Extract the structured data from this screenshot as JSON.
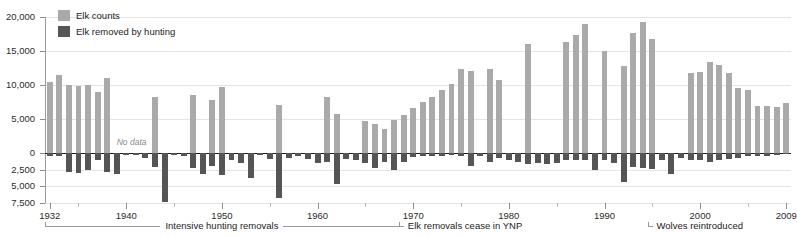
{
  "legend": {
    "items": [
      {
        "label": "Elk counts",
        "color": "#aaaaaa",
        "key": "counts"
      },
      {
        "label": "Elk removed by hunting",
        "color": "#555555",
        "key": "removed"
      }
    ]
  },
  "annotations": {
    "no_data": "No data",
    "brackets": [
      {
        "label": "Intensive hunting removals",
        "start_year": 1932,
        "end_year": 1968,
        "style": "span"
      },
      {
        "label": "Elk removals cease in YNP",
        "start_year": 1969,
        "end_year": 1969,
        "style": "corner"
      },
      {
        "label": "Wolves reintroduced",
        "start_year": 1995,
        "end_year": 1995,
        "style": "corner"
      }
    ]
  },
  "chart_data": {
    "type": "bar",
    "title": "",
    "xlabel": "",
    "ylabel": "",
    "orientation": "vertical",
    "grid": true,
    "legend_position": "top-left",
    "x_range": [
      1932,
      2009
    ],
    "x_ticks": [
      1932,
      1940,
      1950,
      1960,
      1970,
      1980,
      1990,
      2000,
      2009
    ],
    "x_minor_ticks": [
      1935,
      1945,
      1955,
      1965,
      1975,
      1985,
      1995,
      2005
    ],
    "y_axis_note": "Asymmetric scale: above zero 0 to 20,000 in 5,000 steps; below zero 0 to 7,500 in 2,500 steps",
    "y_ticks_positive": [
      0,
      5000,
      10000,
      15000,
      20000
    ],
    "y_ticks_negative": [
      2500,
      5000,
      7500
    ],
    "y_tick_labels": [
      "20,000",
      "15,000",
      "10,000",
      "5,000",
      "0",
      "2,500",
      "5,000",
      "7,500"
    ],
    "ylim_positive": [
      0,
      20000
    ],
    "ylim_negative": [
      0,
      7500
    ],
    "series": [
      {
        "name": "Elk counts",
        "color": "#aaaaaa",
        "direction": "up",
        "values": [
          {
            "year": 1932,
            "value": 10400
          },
          {
            "year": 1933,
            "value": 11400
          },
          {
            "year": 1934,
            "value": 10000
          },
          {
            "year": 1935,
            "value": 9900
          },
          {
            "year": 1936,
            "value": 10000
          },
          {
            "year": 1937,
            "value": 8900
          },
          {
            "year": 1938,
            "value": 11000
          },
          {
            "year": 1939,
            "value": null
          },
          {
            "year": 1940,
            "value": null
          },
          {
            "year": 1941,
            "value": null
          },
          {
            "year": 1942,
            "value": null
          },
          {
            "year": 1943,
            "value": 8300
          },
          {
            "year": 1944,
            "value": null
          },
          {
            "year": 1945,
            "value": null
          },
          {
            "year": 1946,
            "value": null
          },
          {
            "year": 1947,
            "value": 8500
          },
          {
            "year": 1948,
            "value": null
          },
          {
            "year": 1949,
            "value": 7800
          },
          {
            "year": 1950,
            "value": 9700
          },
          {
            "year": 1951,
            "value": null
          },
          {
            "year": 1952,
            "value": null
          },
          {
            "year": 1953,
            "value": null
          },
          {
            "year": 1954,
            "value": null
          },
          {
            "year": 1955,
            "value": null
          },
          {
            "year": 1956,
            "value": 7000
          },
          {
            "year": 1957,
            "value": null
          },
          {
            "year": 1958,
            "value": null
          },
          {
            "year": 1959,
            "value": null
          },
          {
            "year": 1960,
            "value": null
          },
          {
            "year": 1961,
            "value": 8200
          },
          {
            "year": 1962,
            "value": 5700
          },
          {
            "year": 1963,
            "value": null
          },
          {
            "year": 1964,
            "value": null
          },
          {
            "year": 1965,
            "value": 4700
          },
          {
            "year": 1966,
            "value": 4200
          },
          {
            "year": 1967,
            "value": 3500
          },
          {
            "year": 1968,
            "value": 4800
          },
          {
            "year": 1969,
            "value": 5600
          },
          {
            "year": 1970,
            "value": 6600
          },
          {
            "year": 1971,
            "value": 7500
          },
          {
            "year": 1972,
            "value": 8200
          },
          {
            "year": 1973,
            "value": 9200
          },
          {
            "year": 1974,
            "value": 10200
          },
          {
            "year": 1975,
            "value": 12400
          },
          {
            "year": 1976,
            "value": 12000
          },
          {
            "year": 1977,
            "value": null
          },
          {
            "year": 1978,
            "value": 12300
          },
          {
            "year": 1979,
            "value": 10700
          },
          {
            "year": 1980,
            "value": null
          },
          {
            "year": 1981,
            "value": null
          },
          {
            "year": 1982,
            "value": 16000
          },
          {
            "year": 1983,
            "value": null
          },
          {
            "year": 1984,
            "value": null
          },
          {
            "year": 1985,
            "value": null
          },
          {
            "year": 1986,
            "value": 16300
          },
          {
            "year": 1987,
            "value": 17400
          },
          {
            "year": 1988,
            "value": 19000
          },
          {
            "year": 1989,
            "value": null
          },
          {
            "year": 1990,
            "value": 15000
          },
          {
            "year": 1991,
            "value": null
          },
          {
            "year": 1992,
            "value": 12800
          },
          {
            "year": 1993,
            "value": 17600
          },
          {
            "year": 1994,
            "value": 19200
          },
          {
            "year": 1995,
            "value": 16800
          },
          {
            "year": 1996,
            "value": null
          },
          {
            "year": 1997,
            "value": null
          },
          {
            "year": 1998,
            "value": null
          },
          {
            "year": 1999,
            "value": 11800
          },
          {
            "year": 2000,
            "value": 11900
          },
          {
            "year": 2001,
            "value": 13400
          },
          {
            "year": 2002,
            "value": 12900
          },
          {
            "year": 2003,
            "value": 11800
          },
          {
            "year": 2004,
            "value": 9500
          },
          {
            "year": 2005,
            "value": 9200
          },
          {
            "year": 2006,
            "value": 6900
          },
          {
            "year": 2007,
            "value": 6900
          },
          {
            "year": 2008,
            "value": 6700
          },
          {
            "year": 2009,
            "value": 7300
          }
        ]
      },
      {
        "name": "Elk removed by hunting",
        "color": "#555555",
        "direction": "down",
        "values": [
          {
            "year": 1932,
            "value": 500
          },
          {
            "year": 1933,
            "value": 400
          },
          {
            "year": 1934,
            "value": 2800
          },
          {
            "year": 1935,
            "value": 3000
          },
          {
            "year": 1936,
            "value": 2600
          },
          {
            "year": 1937,
            "value": 1100
          },
          {
            "year": 1938,
            "value": 2900
          },
          {
            "year": 1939,
            "value": 3100
          },
          {
            "year": 1940,
            "value": 300
          },
          {
            "year": 1941,
            "value": 300
          },
          {
            "year": 1942,
            "value": 700
          },
          {
            "year": 1943,
            "value": 2100
          },
          {
            "year": 1944,
            "value": 7400
          },
          {
            "year": 1945,
            "value": 300
          },
          {
            "year": 1946,
            "value": 400
          },
          {
            "year": 1947,
            "value": 2300
          },
          {
            "year": 1948,
            "value": 3200
          },
          {
            "year": 1949,
            "value": 2000
          },
          {
            "year": 1950,
            "value": 3300
          },
          {
            "year": 1951,
            "value": 1100
          },
          {
            "year": 1952,
            "value": 1500
          },
          {
            "year": 1953,
            "value": 3700
          },
          {
            "year": 1954,
            "value": 300
          },
          {
            "year": 1955,
            "value": 900
          },
          {
            "year": 1956,
            "value": 6700
          },
          {
            "year": 1957,
            "value": 800
          },
          {
            "year": 1958,
            "value": 500
          },
          {
            "year": 1959,
            "value": 900
          },
          {
            "year": 1960,
            "value": 1500
          },
          {
            "year": 1961,
            "value": 1400
          },
          {
            "year": 1962,
            "value": 4700
          },
          {
            "year": 1963,
            "value": 900
          },
          {
            "year": 1964,
            "value": 1000
          },
          {
            "year": 1965,
            "value": 1500
          },
          {
            "year": 1966,
            "value": 2200
          },
          {
            "year": 1967,
            "value": 1300
          },
          {
            "year": 1968,
            "value": 2600
          },
          {
            "year": 1969,
            "value": 1400
          },
          {
            "year": 1970,
            "value": 600
          },
          {
            "year": 1971,
            "value": 400
          },
          {
            "year": 1972,
            "value": 500
          },
          {
            "year": 1973,
            "value": 400
          },
          {
            "year": 1974,
            "value": 300
          },
          {
            "year": 1975,
            "value": 400
          },
          {
            "year": 1976,
            "value": 1900
          },
          {
            "year": 1977,
            "value": 500
          },
          {
            "year": 1978,
            "value": 1300
          },
          {
            "year": 1979,
            "value": 700
          },
          {
            "year": 1980,
            "value": 1100
          },
          {
            "year": 1981,
            "value": 1400
          },
          {
            "year": 1982,
            "value": 1600
          },
          {
            "year": 1983,
            "value": 1500
          },
          {
            "year": 1984,
            "value": 1700
          },
          {
            "year": 1985,
            "value": 1500
          },
          {
            "year": 1986,
            "value": 1100
          },
          {
            "year": 1987,
            "value": 1100
          },
          {
            "year": 1988,
            "value": 1000
          },
          {
            "year": 1989,
            "value": 2600
          },
          {
            "year": 1990,
            "value": 1100
          },
          {
            "year": 1991,
            "value": 1500
          },
          {
            "year": 1992,
            "value": 4400
          },
          {
            "year": 1993,
            "value": 2100
          },
          {
            "year": 1994,
            "value": 2200
          },
          {
            "year": 1995,
            "value": 2400
          },
          {
            "year": 1996,
            "value": 1000
          },
          {
            "year": 1997,
            "value": 3100
          },
          {
            "year": 1998,
            "value": 700
          },
          {
            "year": 1999,
            "value": 1000
          },
          {
            "year": 2000,
            "value": 1100
          },
          {
            "year": 2001,
            "value": 1400
          },
          {
            "year": 2002,
            "value": 1100
          },
          {
            "year": 2003,
            "value": 900
          },
          {
            "year": 2004,
            "value": 800
          },
          {
            "year": 2005,
            "value": 500
          },
          {
            "year": 2006,
            "value": 400
          },
          {
            "year": 2007,
            "value": 400
          },
          {
            "year": 2008,
            "value": 300
          },
          {
            "year": 2009,
            "value": 200
          }
        ]
      }
    ]
  }
}
